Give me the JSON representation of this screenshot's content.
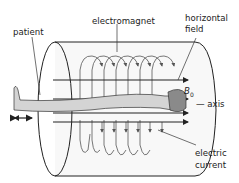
{
  "diagram": {
    "labels": {
      "patient": "patient",
      "electromagnet": "electromagnet",
      "horizontal_field_line1": "horizontal",
      "horizontal_field_line2": "field",
      "b0": "B",
      "b0_sub": "0",
      "axis": "— axis",
      "electric_current_line1": "electric",
      "electric_current_line2": "current"
    },
    "colors": {
      "stroke": "#222222",
      "patient_fill": "#d4d4d4",
      "head_fill": "#8a8a8a",
      "cylinder_fill": "#f7f7f7"
    }
  }
}
